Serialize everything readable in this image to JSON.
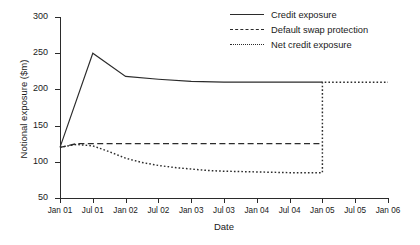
{
  "chart_data": {
    "type": "line",
    "title": "",
    "xlabel": "Date",
    "ylabel": "Notional exposure ($m)",
    "ylim": [
      50,
      300
    ],
    "yticks": [
      50,
      100,
      150,
      200,
      250,
      300
    ],
    "ytick_labels": [
      "50",
      "100",
      "150",
      "200",
      "250",
      "300"
    ],
    "xlim": [
      "Jan 01",
      "Jan 06"
    ],
    "xticks": [
      0,
      0.5,
      1,
      1.5,
      2,
      2.5,
      3,
      3.5,
      4,
      4.5,
      5
    ],
    "xtick_labels": [
      "Jan 01",
      "Jul 01",
      "Jan 02",
      "Jul 02",
      "Jan 03",
      "Jul 03",
      "Jan 04",
      "Jul 04",
      "Jan 05",
      "Jul 05",
      "Jan 06"
    ],
    "grid": false,
    "legend_position": "top-right",
    "series": [
      {
        "name": "Credit exposure",
        "style": "solid",
        "color": "#2b2b2b",
        "x": [
          0,
          0.5,
          1,
          1.5,
          2,
          2.5,
          3,
          3.5,
          4
        ],
        "values": [
          120,
          250,
          218,
          214,
          211,
          210,
          210,
          210,
          210
        ]
      },
      {
        "name": "Default swap protection",
        "style": "dashed",
        "color": "#2b2b2b",
        "x": [
          0,
          0.25,
          0.5,
          1,
          1.5,
          2,
          2.5,
          3,
          3.5,
          4
        ],
        "values": [
          120,
          125,
          125,
          125,
          125,
          125,
          125,
          125,
          125,
          125
        ]
      },
      {
        "name": "Net credit exposure",
        "style": "dotted",
        "color": "#2b2b2b",
        "x": [
          0,
          0.25,
          0.5,
          0.75,
          1,
          1.25,
          1.5,
          1.75,
          2,
          2.25,
          2.5,
          3,
          3.5,
          4,
          4,
          4.5,
          5
        ],
        "values": [
          120,
          124,
          122,
          114,
          105,
          99,
          95,
          92,
          90,
          88,
          87,
          86,
          85,
          85,
          210,
          210,
          210
        ]
      }
    ],
    "annotations": [
      {
        "label": "Net credit exposure steps up to the credit exposure level at Jan 05",
        "x": 4,
        "y": 210
      }
    ]
  }
}
